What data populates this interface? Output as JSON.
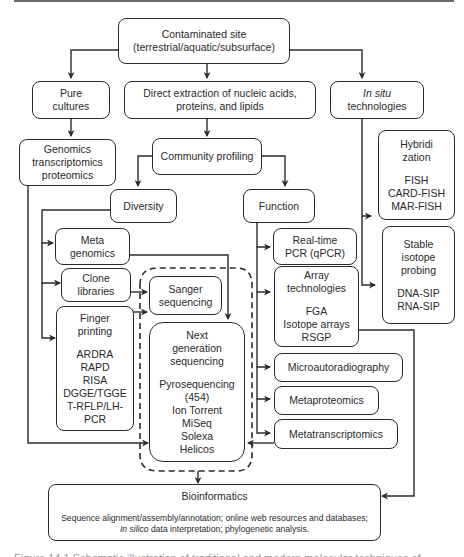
{
  "diagram": {
    "nodes": {
      "site": {
        "line1": "Contaminated site",
        "line2": "(terrestrial/aquatic/subsurface)"
      },
      "pure": {
        "line1": "Pure",
        "line2": "cultures"
      },
      "direct": {
        "line1": "Direct extraction of nucleic acids,",
        "line2": "proteins, and lipids"
      },
      "insitu": {
        "line1": "In situ",
        "line2": "technologies"
      },
      "genomics": {
        "line1": "Genomics",
        "line2": "transcriptomics",
        "line3": "proteomics"
      },
      "community": {
        "label": "Community profiling"
      },
      "diversity": {
        "label": "Diversity"
      },
      "function": {
        "label": "Function"
      },
      "hybrid": {
        "line1": "Hybridi",
        "line2": "zation",
        "items": [
          "FISH",
          "CARD-FISH",
          "MAR-FISH"
        ]
      },
      "sip": {
        "line1": "Stable",
        "line2": "isotope",
        "line3": "probing",
        "items": [
          "DNA-SIP",
          "RNA-SIP"
        ]
      },
      "metagenomics": {
        "line1": "Meta",
        "line2": "genomics"
      },
      "qpcr": {
        "line1": "Real-time",
        "line2": "PCR (qPCR)"
      },
      "clone": {
        "line1": "Clone",
        "line2": "libraries"
      },
      "sanger": {
        "line1": "Sanger",
        "line2": "sequencing"
      },
      "array": {
        "line1": "Array",
        "line2": "technologies",
        "items": [
          "FGA",
          "Isotope arrays",
          "RSGP"
        ]
      },
      "finger": {
        "line1": "Finger",
        "line2": "printing",
        "items": [
          "ARDRA",
          "RAPD",
          "RISA",
          "DGGE/TGGE",
          "T-RFLP/LH-",
          "PCR"
        ]
      },
      "ngs": {
        "line1": "Next",
        "line2": "generation",
        "line3": "sequencing",
        "items": [
          "Pyrosequencing",
          "(454)",
          "Ion Torrent",
          "MiSeq",
          "Solexa",
          "Helicos"
        ]
      },
      "microauto": {
        "label": "Microautoradiography"
      },
      "metaprot": {
        "label": "Metaproteomics"
      },
      "metatrans": {
        "label": "Metatranscriptomics"
      },
      "bio": {
        "title": "Bioinformatics",
        "desc_line1": "Sequence alignment/assembly/annotation; online web resources and databases;",
        "desc_line2_italic": "In silico",
        "desc_line2_rest": " data interpretation; phylogenetic analysis."
      }
    },
    "caption": "Figure 14.1 Schematic illustration of traditional and modern molecular techniques of"
  }
}
